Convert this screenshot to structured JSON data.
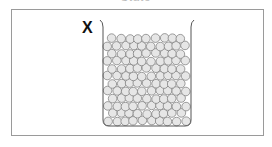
{
  "diagram": {
    "top_caption": "State",
    "label": "X",
    "container": "beaker",
    "content": "closely packed particles (solid)",
    "colors": {
      "frame": "#9a9a9a",
      "beaker_outline": "#555555",
      "particle_fill": "#e6e6e6",
      "particle_stroke": "#777777"
    }
  }
}
